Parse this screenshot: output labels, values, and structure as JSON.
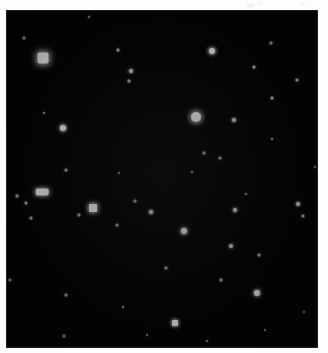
{
  "image": {
    "kind": "astronomical-star-field",
    "title": "Star field image",
    "width": 328,
    "height": 353,
    "background_color": "#ffffff",
    "sky_color": "#030303",
    "star_color": "#ffffff"
  },
  "frame": {
    "left": 6,
    "top": 10,
    "width": 312,
    "height": 338
  },
  "margin_marks": [
    {
      "name": "top-smudge-1",
      "x": 247,
      "y": 4,
      "w": 7,
      "h": 3,
      "opacity": 0.5
    },
    {
      "name": "top-smudge-2",
      "x": 258,
      "y": 2,
      "w": 5,
      "h": 2,
      "opacity": 0.35
    },
    {
      "name": "top-smudge-3",
      "x": 300,
      "y": 3,
      "w": 6,
      "h": 2,
      "opacity": 0.3
    }
  ],
  "chart_data": {
    "type": "scatter",
    "xlabel": "",
    "ylabel": "",
    "xlim": [
      0,
      312
    ],
    "ylim": [
      0,
      338
    ],
    "grid": false,
    "legend": "none",
    "note": "Positions are pixel coordinates within the sky frame; size ~ apparent diameter in px; brightness ~ relative peak intensity 0-1.",
    "stars": [
      {
        "id": 1,
        "x": 37,
        "y": 48,
        "size": 11,
        "brightness": 1.0,
        "shape": "sq",
        "halo": 20
      },
      {
        "id": 2,
        "x": 190,
        "y": 107,
        "size": 10,
        "brightness": 0.98,
        "shape": "round",
        "halo": 19
      },
      {
        "id": 3,
        "x": 206,
        "y": 41,
        "size": 6,
        "brightness": 0.85,
        "shape": "round",
        "halo": 12
      },
      {
        "id": 4,
        "x": 87,
        "y": 198,
        "size": 8,
        "brightness": 0.92,
        "shape": "sq",
        "halo": 15
      },
      {
        "id": 5,
        "x": 36,
        "y": 182,
        "size": 7,
        "brightness": 0.8,
        "shape": "elong",
        "halo": 12,
        "stretch": 1.8
      },
      {
        "id": 6,
        "x": 57,
        "y": 118,
        "size": 6,
        "brightness": 0.88,
        "shape": "round",
        "halo": 11
      },
      {
        "id": 7,
        "x": 178,
        "y": 221,
        "size": 6,
        "brightness": 0.82,
        "shape": "round",
        "halo": 11
      },
      {
        "id": 8,
        "x": 169,
        "y": 313,
        "size": 6,
        "brightness": 0.84,
        "shape": "sq",
        "halo": 11
      },
      {
        "id": 9,
        "x": 251,
        "y": 283,
        "size": 6,
        "brightness": 0.8,
        "shape": "round",
        "halo": 10
      },
      {
        "id": 10,
        "x": 145,
        "y": 202,
        "size": 4,
        "brightness": 0.68,
        "shape": "round",
        "halo": 8
      },
      {
        "id": 11,
        "x": 125,
        "y": 61,
        "size": 4,
        "brightness": 0.62,
        "shape": "round",
        "halo": 7
      },
      {
        "id": 12,
        "x": 229,
        "y": 200,
        "size": 4,
        "brightness": 0.6,
        "shape": "round",
        "halo": 7
      },
      {
        "id": 13,
        "x": 228,
        "y": 110,
        "size": 4,
        "brightness": 0.58,
        "shape": "round",
        "halo": 7
      },
      {
        "id": 14,
        "x": 225,
        "y": 236,
        "size": 4,
        "brightness": 0.55,
        "shape": "round",
        "halo": 6
      },
      {
        "id": 15,
        "x": 292,
        "y": 194,
        "size": 4,
        "brightness": 0.58,
        "shape": "round",
        "halo": 7
      },
      {
        "id": 16,
        "x": 291,
        "y": 70,
        "size": 3,
        "brightness": 0.45,
        "shape": "round",
        "halo": 5
      },
      {
        "id": 17,
        "x": 123,
        "y": 71,
        "size": 3,
        "brightness": 0.4,
        "shape": "round",
        "halo": 5
      },
      {
        "id": 18,
        "x": 112,
        "y": 40,
        "size": 3,
        "brightness": 0.38,
        "shape": "round",
        "halo": 5
      },
      {
        "id": 19,
        "x": 18,
        "y": 28,
        "size": 3,
        "brightness": 0.36,
        "shape": "round",
        "halo": 5
      },
      {
        "id": 20,
        "x": 248,
        "y": 57,
        "size": 3,
        "brightness": 0.4,
        "shape": "round",
        "halo": 5
      },
      {
        "id": 21,
        "x": 265,
        "y": 33,
        "size": 3,
        "brightness": 0.34,
        "shape": "round",
        "halo": 4
      },
      {
        "id": 22,
        "x": 266,
        "y": 88,
        "size": 3,
        "brightness": 0.36,
        "shape": "round",
        "halo": 4
      },
      {
        "id": 23,
        "x": 198,
        "y": 143,
        "size": 3,
        "brightness": 0.35,
        "shape": "round",
        "halo": 4
      },
      {
        "id": 24,
        "x": 214,
        "y": 148,
        "size": 3,
        "brightness": 0.33,
        "shape": "round",
        "halo": 4
      },
      {
        "id": 25,
        "x": 60,
        "y": 160,
        "size": 3,
        "brightness": 0.32,
        "shape": "round",
        "halo": 4
      },
      {
        "id": 26,
        "x": 11,
        "y": 186,
        "size": 3,
        "brightness": 0.36,
        "shape": "round",
        "halo": 4
      },
      {
        "id": 27,
        "x": 20,
        "y": 193,
        "size": 3,
        "brightness": 0.34,
        "shape": "round",
        "halo": 4
      },
      {
        "id": 28,
        "x": 73,
        "y": 205,
        "size": 3,
        "brightness": 0.32,
        "shape": "round",
        "halo": 4
      },
      {
        "id": 29,
        "x": 129,
        "y": 191,
        "size": 3,
        "brightness": 0.34,
        "shape": "round",
        "halo": 4
      },
      {
        "id": 30,
        "x": 25,
        "y": 208,
        "size": 3,
        "brightness": 0.3,
        "shape": "round",
        "halo": 4
      },
      {
        "id": 31,
        "x": 111,
        "y": 215,
        "size": 3,
        "brightness": 0.3,
        "shape": "round",
        "halo": 4
      },
      {
        "id": 32,
        "x": 297,
        "y": 206,
        "size": 3,
        "brightness": 0.33,
        "shape": "round",
        "halo": 4
      },
      {
        "id": 33,
        "x": 253,
        "y": 245,
        "size": 3,
        "brightness": 0.3,
        "shape": "round",
        "halo": 4
      },
      {
        "id": 34,
        "x": 215,
        "y": 270,
        "size": 3,
        "brightness": 0.3,
        "shape": "round",
        "halo": 4
      },
      {
        "id": 35,
        "x": 4,
        "y": 270,
        "size": 3,
        "brightness": 0.32,
        "shape": "round",
        "halo": 4
      },
      {
        "id": 36,
        "x": 160,
        "y": 258,
        "size": 3,
        "brightness": 0.28,
        "shape": "round",
        "halo": 4
      },
      {
        "id": 37,
        "x": 60,
        "y": 285,
        "size": 3,
        "brightness": 0.32,
        "shape": "round",
        "halo": 4
      },
      {
        "id": 38,
        "x": 58,
        "y": 326,
        "size": 3,
        "brightness": 0.28,
        "shape": "round",
        "halo": 4
      },
      {
        "id": 39,
        "x": 201,
        "y": 331,
        "size": 2,
        "brightness": 0.25,
        "shape": "round",
        "halo": 3
      },
      {
        "id": 40,
        "x": 298,
        "y": 302,
        "size": 2,
        "brightness": 0.25,
        "shape": "round",
        "halo": 3
      },
      {
        "id": 41,
        "x": 117,
        "y": 297,
        "size": 2,
        "brightness": 0.24,
        "shape": "round",
        "halo": 3
      },
      {
        "id": 42,
        "x": 309,
        "y": 157,
        "size": 2,
        "brightness": 0.24,
        "shape": "round",
        "halo": 3
      },
      {
        "id": 43,
        "x": 186,
        "y": 162,
        "size": 2,
        "brightness": 0.24,
        "shape": "round",
        "halo": 3
      },
      {
        "id": 44,
        "x": 266,
        "y": 129,
        "size": 2,
        "brightness": 0.22,
        "shape": "round",
        "halo": 3
      },
      {
        "id": 45,
        "x": 38,
        "y": 103,
        "size": 2,
        "brightness": 0.22,
        "shape": "round",
        "halo": 3
      },
      {
        "id": 46,
        "x": 240,
        "y": 184,
        "size": 2,
        "brightness": 0.22,
        "shape": "round",
        "halo": 3
      },
      {
        "id": 47,
        "x": 113,
        "y": 163,
        "size": 2,
        "brightness": 0.22,
        "shape": "round",
        "halo": 3
      },
      {
        "id": 48,
        "x": 83,
        "y": 7,
        "size": 2,
        "brightness": 0.3,
        "shape": "round",
        "halo": 3
      },
      {
        "id": 49,
        "x": 259,
        "y": 320,
        "size": 2,
        "brightness": 0.2,
        "shape": "round",
        "halo": 3
      },
      {
        "id": 50,
        "x": 141,
        "y": 325,
        "size": 2,
        "brightness": 0.2,
        "shape": "round",
        "halo": 3
      }
    ]
  }
}
